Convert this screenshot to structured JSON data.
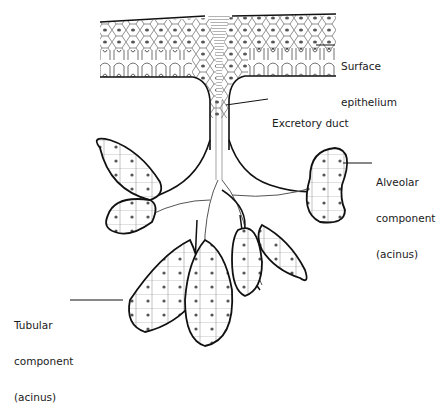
{
  "diagram": {
    "structures": [
      "surface epithelium",
      "excretory duct",
      "branching ducts",
      "alveolar acini",
      "tubular acini"
    ],
    "colors": {
      "line": "#111111",
      "fill": "#ffffff",
      "nucleus": "#333333"
    }
  },
  "labels": {
    "surface_epithelium": {
      "line1": "Surface",
      "line2": "epithelium"
    },
    "excretory_duct": {
      "text": "Excretory duct"
    },
    "alveolar_component": {
      "line1": "Alveolar",
      "line2": "component",
      "line3": "(acinus)"
    },
    "tubular_component": {
      "line1": "Tubular",
      "line2": "component",
      "line3": "(acinus)"
    }
  }
}
